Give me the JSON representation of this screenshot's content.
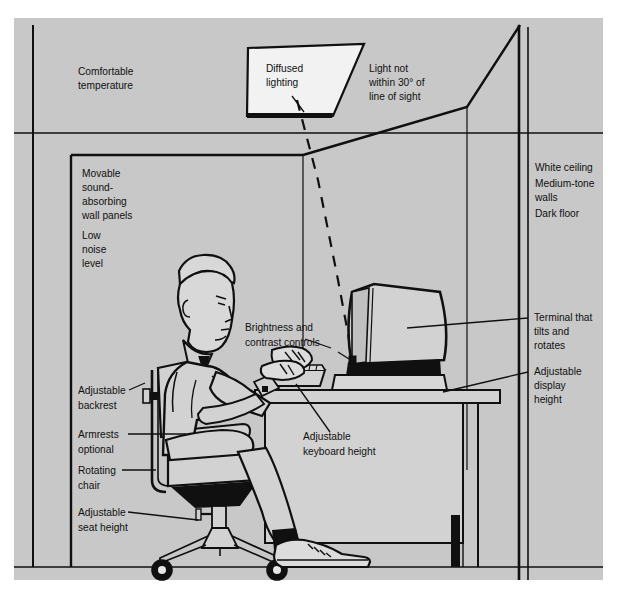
{
  "figure": {
    "name": "ergonomic-workstation-diagram",
    "background_color": "#c8c8c8",
    "page_color": "#ffffff",
    "line_color": "#101010",
    "panel": {
      "x": 14,
      "y": 18,
      "width": 589,
      "height": 562
    }
  },
  "labels": {
    "comfortable_temperature": [
      "Comfortable",
      "temperature"
    ],
    "diffused_lighting": [
      "Diffused",
      "lighting"
    ],
    "light_not_within": [
      "Light not",
      "within 30° of",
      "line of sight"
    ],
    "wall_panels": [
      "Movable",
      "sound-",
      "absorbing",
      "wall panels"
    ],
    "low_noise": [
      "Low",
      "noise",
      "level"
    ],
    "surfaces": [
      "White ceiling",
      "Medium-tone",
      "walls",
      "Dark floor"
    ],
    "terminal_tilts": [
      "Terminal that",
      "tilts and",
      "rotates"
    ],
    "display_height": [
      "Adjustable",
      "display",
      "height"
    ],
    "brightness_contrast": [
      "Brightness and",
      "contrast controls"
    ],
    "adjustable_backrest": [
      "Adjustable",
      "backrest"
    ],
    "armrests_optional": [
      "Armrests",
      "optional"
    ],
    "rotating_chair": [
      "Rotating",
      "chair"
    ],
    "adjustable_seat_height": [
      "Adjustable",
      "seat height"
    ],
    "keyboard_height": [
      "Adjustable",
      "keyboard height"
    ]
  },
  "objects": {
    "light_fixture": "diffused-ceiling-light-panel",
    "monitor": "crt-terminal-on-tilt-swivel-base",
    "keyboard": "detached-keyboard",
    "desk": "work-desk",
    "chair": "five-star-rotating-office-chair",
    "person": "seated-operator"
  }
}
